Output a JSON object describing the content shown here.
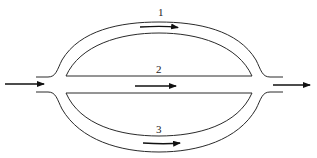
{
  "diagram": {
    "type": "parallel-flow-paths",
    "inlet": {
      "label": "",
      "direction": "right"
    },
    "outlet": {
      "label": "",
      "direction": "right"
    },
    "paths": [
      {
        "id": "path-1",
        "label": "1",
        "position": "top",
        "shape": "arc",
        "flow_direction": "right"
      },
      {
        "id": "path-2",
        "label": "2",
        "position": "middle",
        "shape": "straight",
        "flow_direction": "right"
      },
      {
        "id": "path-3",
        "label": "3",
        "position": "bottom",
        "shape": "arc",
        "flow_direction": "right"
      }
    ],
    "colors": {
      "line": "#2a2a2a",
      "background": "#ffffff"
    }
  }
}
